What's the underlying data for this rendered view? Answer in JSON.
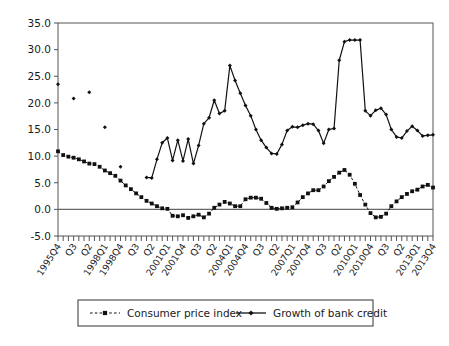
{
  "chart_data": {
    "type": "line",
    "title": "",
    "subtitle": "",
    "xlabel": "",
    "ylabel": "",
    "ylim": [
      -5.0,
      35.0
    ],
    "ytick_step": 5.0,
    "ytick_labels": [
      "35.0",
      "30.0",
      "25.0",
      "20.0",
      "15.0",
      "10.0",
      "5.0",
      "0.0",
      "-5.0"
    ],
    "grid": false,
    "zero_line": true,
    "legend_position": "bottom",
    "x": [
      "1995Q4",
      "1996Q1",
      "1996Q2",
      "1996Q3",
      "1996Q4",
      "1997Q1",
      "1997Q2",
      "1997Q3",
      "1997Q4",
      "1998Q1",
      "1998Q2",
      "1998Q3",
      "1998Q4",
      "1999Q1",
      "1999Q2",
      "1999Q3",
      "1999Q4",
      "2000Q1",
      "2000Q2",
      "2000Q3",
      "2000Q4",
      "2001Q1",
      "2001Q2",
      "2001Q3",
      "2001Q4",
      "2002Q1",
      "2002Q2",
      "2002Q3",
      "2002Q4",
      "2003Q1",
      "2003Q2",
      "2003Q3",
      "2003Q4",
      "2004Q1",
      "2004Q2",
      "2004Q3",
      "2004Q4",
      "2005Q1",
      "2005Q2",
      "2005Q3",
      "2005Q4",
      "2006Q1",
      "2006Q2",
      "2006Q3",
      "2006Q4",
      "2007Q1",
      "2007Q2",
      "2007Q3",
      "2007Q4",
      "2008Q1",
      "2008Q2",
      "2008Q3",
      "2008Q4",
      "2009Q1",
      "2009Q2",
      "2009Q3",
      "2009Q4",
      "2010Q1",
      "2010Q2",
      "2010Q3",
      "2010Q4",
      "2011Q1",
      "2011Q2",
      "2011Q3",
      "2011Q4",
      "2012Q1",
      "2012Q2",
      "2012Q3",
      "2012Q4",
      "2013Q1",
      "2013Q2",
      "2013Q3",
      "2013Q4"
    ],
    "xtick_labels": [
      {
        "index": 0,
        "label": "1995Q4"
      },
      {
        "index": 3,
        "label": "Q3"
      },
      {
        "index": 6,
        "label": "Q2"
      },
      {
        "index": 9,
        "label": "1998Q1"
      },
      {
        "index": 12,
        "label": "1998Q4"
      },
      {
        "index": 15,
        "label": "Q3"
      },
      {
        "index": 18,
        "label": "Q2"
      },
      {
        "index": 21,
        "label": "2001Q1"
      },
      {
        "index": 24,
        "label": "2001Q4"
      },
      {
        "index": 27,
        "label": "Q3"
      },
      {
        "index": 30,
        "label": "Q2"
      },
      {
        "index": 33,
        "label": "2004Q1"
      },
      {
        "index": 36,
        "label": "2004Q4"
      },
      {
        "index": 39,
        "label": "Q3"
      },
      {
        "index": 42,
        "label": "Q2"
      },
      {
        "index": 45,
        "label": "2007Q1"
      },
      {
        "index": 48,
        "label": "2007Q4"
      },
      {
        "index": 51,
        "label": "Q3"
      },
      {
        "index": 54,
        "label": "Q2"
      },
      {
        "index": 57,
        "label": "2010Q1"
      },
      {
        "index": 60,
        "label": "2010Q4"
      },
      {
        "index": 63,
        "label": "Q3"
      },
      {
        "index": 66,
        "label": "Q2"
      },
      {
        "index": 69,
        "label": "2013Q1"
      },
      {
        "index": 72,
        "label": "2013Q4"
      }
    ],
    "series": [
      {
        "name": "Consumer price index",
        "style": "dashed",
        "marker": "square",
        "color": "#111111",
        "values": [
          10.9,
          10.2,
          9.9,
          9.7,
          9.4,
          9.0,
          8.6,
          8.5,
          8.0,
          7.3,
          6.8,
          6.3,
          5.4,
          4.5,
          3.8,
          3.0,
          2.3,
          1.6,
          1.1,
          0.6,
          0.2,
          0.1,
          -1.2,
          -1.3,
          -1.1,
          -1.6,
          -1.3,
          -1.0,
          -1.5,
          -0.8,
          0.3,
          0.9,
          1.4,
          1.1,
          0.6,
          0.6,
          1.9,
          2.2,
          2.2,
          2.0,
          1.2,
          0.3,
          0.1,
          0.2,
          0.3,
          0.4,
          1.3,
          2.3,
          3.0,
          3.6,
          3.6,
          4.3,
          5.3,
          6.1,
          6.9,
          7.4,
          6.5,
          4.8,
          2.7,
          0.9,
          -0.7,
          -1.5,
          -1.4,
          -0.8,
          0.6,
          1.5,
          2.3,
          2.9,
          3.4,
          3.7,
          4.3,
          4.6,
          4.1
        ],
        "segments": [
          [
            0,
            72
          ]
        ]
      },
      {
        "name": "Growth of bank credit",
        "style": "solid",
        "marker": "diamond",
        "color": "#111111",
        "values": [
          23.5,
          null,
          null,
          20.8,
          null,
          null,
          22.0,
          null,
          null,
          15.4,
          null,
          null,
          8.0,
          null,
          null,
          null,
          null,
          6.0,
          5.9,
          9.4,
          12.5,
          13.4,
          9.2,
          13.0,
          9.1,
          13.2,
          8.6,
          12.0,
          16.1,
          17.2,
          20.5,
          18.0,
          18.5,
          27.0,
          24.2,
          21.8,
          19.5,
          17.6,
          15.0,
          13.0,
          11.6,
          10.5,
          10.4,
          12.2,
          14.8,
          15.5,
          15.4,
          15.8,
          16.1,
          16.0,
          14.8,
          12.4,
          15.0,
          15.2,
          28.0,
          31.5,
          31.8,
          31.8,
          31.8,
          18.5,
          17.6,
          18.6,
          19.0,
          17.8,
          15.0,
          13.6,
          13.4,
          14.7,
          15.6,
          14.8,
          13.8,
          13.9,
          14.0
        ],
        "segments": [
          [
            0,
            0
          ],
          [
            3,
            3
          ],
          [
            6,
            6
          ],
          [
            9,
            9
          ],
          [
            12,
            12
          ],
          [
            17,
            72
          ]
        ]
      }
    ]
  },
  "legend": {
    "items": [
      {
        "label": "Consumer price index",
        "marker": "square",
        "style": "dashed"
      },
      {
        "label": "Growth of bank credit",
        "marker": "diamond",
        "style": "solid"
      }
    ]
  }
}
